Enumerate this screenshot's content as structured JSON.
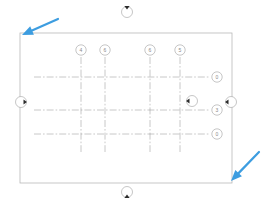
{
  "document": {
    "title": "Plan View Grid",
    "canvas_width": 270,
    "canvas_height": 209,
    "background_color": "#ffffff"
  },
  "colors": {
    "annotation_arrow": "#3d9de0",
    "outline": "#b8b8b8",
    "gridline": "#9a9a9a",
    "bubble_stroke": "#a0a0a0",
    "bubble_fill": "#ffffff",
    "bubble_text": "#8a8a8a",
    "marker_triangle": "#2b2b2b"
  },
  "plan_outline": {
    "name": "building-outline",
    "x": 20,
    "y": 33,
    "width": 212,
    "height": 150,
    "stroke_width": 0.8
  },
  "grid": {
    "line_style": "dash-dot",
    "vertical_axes": [
      {
        "id": "v1",
        "label": "4",
        "x": 81,
        "bubble_y": 50,
        "line_top": 57,
        "line_bottom": 152
      },
      {
        "id": "v2",
        "label": "6",
        "x": 105,
        "bubble_y": 50,
        "line_top": 57,
        "line_bottom": 152
      },
      {
        "id": "v3",
        "label": "6",
        "x": 150,
        "bubble_y": 50,
        "line_top": 57,
        "line_bottom": 152
      },
      {
        "id": "v4",
        "label": "5",
        "x": 180,
        "bubble_y": 50,
        "line_top": 57,
        "line_bottom": 152
      }
    ],
    "horizontal_axes": [
      {
        "id": "h1",
        "label": "0",
        "y": 77,
        "bubble_x": 217,
        "line_left": 34,
        "line_right": 210
      },
      {
        "id": "h2",
        "label": "3",
        "y": 110,
        "bubble_x": 217,
        "line_left": 34,
        "line_right": 210
      },
      {
        "id": "h3",
        "label": "0",
        "y": 134,
        "bubble_x": 217,
        "line_left": 34,
        "line_right": 210
      }
    ],
    "bubble_radius": 5.2
  },
  "section_markers": [
    {
      "id": "sm-top",
      "name": "section-marker-top",
      "x": 127,
      "y": 12,
      "direction": "down",
      "radius": 5.5
    },
    {
      "id": "sm-bottom",
      "name": "section-marker-bottom",
      "x": 127,
      "y": 192,
      "direction": "up",
      "radius": 5.5
    },
    {
      "id": "sm-left",
      "name": "section-marker-left",
      "x": 21,
      "y": 102,
      "direction": "right",
      "radius": 5.5
    },
    {
      "id": "sm-right",
      "name": "section-marker-right",
      "x": 231,
      "y": 102,
      "direction": "left",
      "radius": 5.5
    },
    {
      "id": "sm-inner",
      "name": "section-marker-inner",
      "x": 192,
      "y": 101,
      "direction": "left",
      "radius": 5.5
    }
  ],
  "annotations": {
    "arrows": [
      {
        "id": "arrow-top-left",
        "name": "callout-arrow-top-left",
        "tail_x": 58,
        "tail_y": 19,
        "head_x": 22,
        "head_y": 35,
        "stroke_width": 2.2
      },
      {
        "id": "arrow-bottom-right",
        "name": "callout-arrow-bottom-right",
        "tail_x": 259,
        "tail_y": 152,
        "head_x": 231,
        "head_y": 181,
        "stroke_width": 2.2
      }
    ]
  }
}
